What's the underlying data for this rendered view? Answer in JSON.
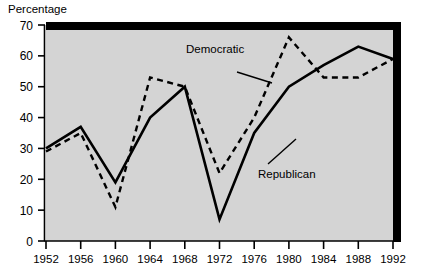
{
  "chart_data": {
    "type": "line",
    "title": "",
    "ylabel": "Percentage",
    "xlabel": "",
    "ylim": [
      0,
      70
    ],
    "xlim": [
      1952,
      1992
    ],
    "grid": false,
    "legend_position": "inline-annotations",
    "x": [
      1952,
      1956,
      1960,
      1964,
      1968,
      1972,
      1976,
      1980,
      1984,
      1988,
      1992
    ],
    "xtick_labels": [
      "1952",
      "1956",
      "1960",
      "1964",
      "1968",
      "1972",
      "1976",
      "1980",
      "1984",
      "1988",
      "1992"
    ],
    "ytick_labels": [
      "0",
      "10",
      "20",
      "30",
      "40",
      "50",
      "60",
      "70"
    ],
    "ytick_values": [
      0,
      10,
      20,
      30,
      40,
      50,
      60,
      70
    ],
    "series": [
      {
        "name": "Democratic",
        "style": "dashed",
        "color": "#000000",
        "values": [
          29,
          35,
          11,
          53,
          50,
          22,
          40,
          66,
          53,
          53,
          59
        ]
      },
      {
        "name": "Republican",
        "style": "solid",
        "color": "#000000",
        "values": [
          30,
          37,
          19,
          40,
          50,
          7,
          35,
          50,
          57,
          63,
          59
        ]
      }
    ],
    "annotations": [
      {
        "name": "Democratic",
        "label": "Democratic"
      },
      {
        "name": "Republican",
        "label": "Republican"
      }
    ]
  },
  "plot_colors": {
    "plot_background": "#d4d4d4",
    "shadow": "#000000",
    "axis": "#000000",
    "page_background": "#ffffff"
  }
}
